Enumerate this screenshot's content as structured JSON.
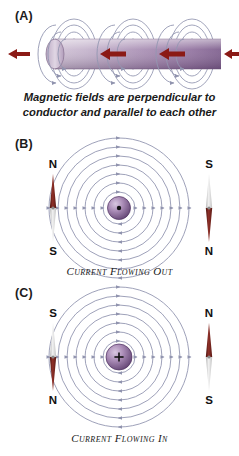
{
  "figure": {
    "background": "#ffffff",
    "accent_conductor": "#8c6f94",
    "accent_arrow_red": "#8b1a16",
    "accent_field_line": "#8f92ad",
    "accent_hub": "#6e4c82",
    "needle_north_color": "#6e221c",
    "needle_south_color": "#cfcfcf"
  },
  "panels": {
    "a": {
      "label": "(A)",
      "caption_line1": "Magnetic fields are perpendicular to",
      "caption_line2": "conductor and parallel to each other",
      "conductor_name": "conductor-rod",
      "current_arrows": 4,
      "field_loop_groups": 3
    },
    "b": {
      "label": "(B)",
      "caption": "Current Flowing Out",
      "center_symbol": "•",
      "center_symbol_name": "current-out-of-page-dot",
      "rings": 7,
      "left_compass": {
        "top_pole": "N",
        "bottom_pole": "S",
        "needle_points": "up"
      },
      "right_compass": {
        "top_pole": "S",
        "bottom_pole": "N",
        "needle_points": "down"
      }
    },
    "c": {
      "label": "(C)",
      "caption": "Current Flowing In",
      "center_symbol": "+",
      "center_symbol_name": "current-into-page-cross",
      "rings": 7,
      "left_compass": {
        "top_pole": "S",
        "bottom_pole": "N",
        "needle_points": "down"
      },
      "right_compass": {
        "top_pole": "N",
        "bottom_pole": "S",
        "needle_points": "up"
      }
    }
  }
}
